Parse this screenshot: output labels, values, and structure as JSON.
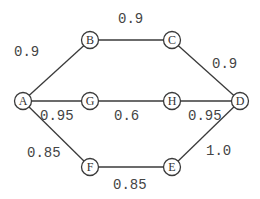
{
  "diagram": {
    "type": "weighted-graph",
    "colors": {
      "stroke": "#3a3a3a",
      "text": "#444444",
      "background": "#ffffff"
    },
    "nodes": [
      {
        "id": "A",
        "label": "A",
        "x": 23,
        "y": 101
      },
      {
        "id": "B",
        "label": "B",
        "x": 90,
        "y": 40
      },
      {
        "id": "C",
        "label": "C",
        "x": 172,
        "y": 40
      },
      {
        "id": "D",
        "label": "D",
        "x": 240,
        "y": 101
      },
      {
        "id": "E",
        "label": "E",
        "x": 172,
        "y": 167
      },
      {
        "id": "F",
        "label": "F",
        "x": 90,
        "y": 167
      },
      {
        "id": "G",
        "label": "G",
        "x": 90,
        "y": 101
      },
      {
        "id": "H",
        "label": "H",
        "x": 172,
        "y": 101
      }
    ],
    "edges": [
      {
        "from": "A",
        "to": "B",
        "weight": "0.9",
        "lx": 14,
        "ly": 56
      },
      {
        "from": "B",
        "to": "C",
        "weight": "0.9",
        "lx": 118,
        "ly": 23
      },
      {
        "from": "C",
        "to": "D",
        "weight": "0.9",
        "lx": 212,
        "ly": 68
      },
      {
        "from": "A",
        "to": "G",
        "weight": "0.95",
        "lx": 40,
        "ly": 120
      },
      {
        "from": "G",
        "to": "H",
        "weight": "0.6",
        "lx": 114,
        "ly": 120
      },
      {
        "from": "H",
        "to": "D",
        "weight": "0.95",
        "lx": 188,
        "ly": 120
      },
      {
        "from": "A",
        "to": "F",
        "weight": "0.85",
        "lx": 27,
        "ly": 157
      },
      {
        "from": "F",
        "to": "E",
        "weight": "0.85",
        "lx": 113,
        "ly": 189
      },
      {
        "from": "E",
        "to": "D",
        "weight": "1.0",
        "lx": 206,
        "ly": 155
      }
    ]
  }
}
